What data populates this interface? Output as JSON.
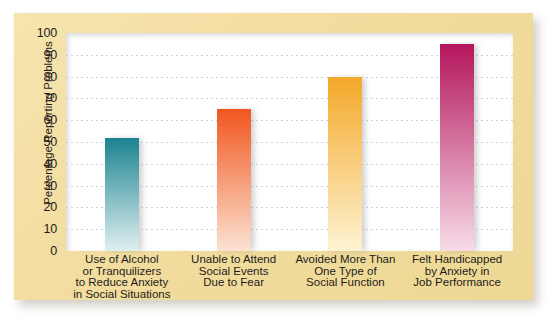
{
  "chart_data": {
    "type": "bar",
    "title": "",
    "xlabel": "",
    "ylabel": "Percentage Reporting Problems",
    "ylim": [
      0,
      100
    ],
    "ytick_step": 10,
    "grid": true,
    "legend": "none",
    "yticks": [
      "100",
      "90",
      "80",
      "70",
      "60",
      "50",
      "40",
      "30",
      "20",
      "10",
      "0"
    ],
    "categories": [
      "Use of Alcohol or Tranquilizers to Reduce Anxiety in Social Situations",
      "Unable to Attend Social Events Due to Fear",
      "Avoided More Than One Type of Social Function",
      "Felt Handicapped by Anxiety in Job Performance"
    ],
    "category_lines": [
      [
        "Use of Alcohol",
        "or Tranquilizers",
        "to Reduce Anxiety",
        "in Social Situations"
      ],
      [
        "Unable to Attend",
        "Social Events",
        "Due to Fear"
      ],
      [
        "Avoided More Than",
        "One Type of",
        "Social Function"
      ],
      [
        "Felt Handicapped",
        "by Anxiety in",
        "Job Performance"
      ]
    ],
    "values": [
      52,
      65,
      80,
      95
    ],
    "bar_colors_top": [
      "#1c8391",
      "#f1561f",
      "#f4a82a",
      "#b4165c"
    ],
    "bar_colors_bottom": [
      "#dff0f0",
      "#fbe2d2",
      "#fdf3d2",
      "#f7dce8"
    ]
  },
  "style": {
    "panel_color": "#f2dc9e",
    "plot_background": "#ffffff",
    "gridline_color": "#c9d4e4",
    "text_color": "#1d1d1b"
  }
}
